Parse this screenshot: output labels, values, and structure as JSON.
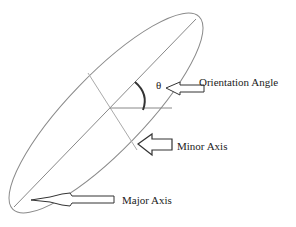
{
  "diagram": {
    "type": "ellipse-orientation",
    "labels": {
      "theta": "θ",
      "orientation_angle": "Orientation Angle",
      "minor_axis": "Minor Axis",
      "major_axis": "Major Axis"
    },
    "colors": {
      "ellipse": "#777777",
      "axes": "#888888",
      "arrow": "#333333",
      "text": "#222222"
    }
  }
}
